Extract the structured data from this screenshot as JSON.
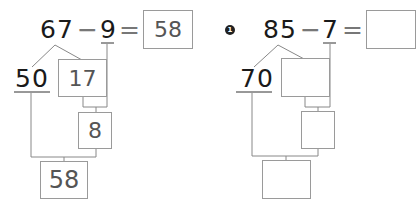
{
  "problems": [
    {
      "label": "",
      "minuend": "67",
      "minus": "−",
      "subtrahend": "9",
      "equals": "=",
      "answer": "58",
      "decomposed_tens": "50",
      "decomposed_rest": "17",
      "step_result": "8",
      "final_result": "58"
    },
    {
      "label": "1",
      "minuend": "85",
      "minus": "−",
      "subtrahend": "7",
      "equals": "=",
      "answer": "",
      "decomposed_tens": "70",
      "decomposed_rest": "",
      "step_result": "",
      "final_result": ""
    }
  ]
}
